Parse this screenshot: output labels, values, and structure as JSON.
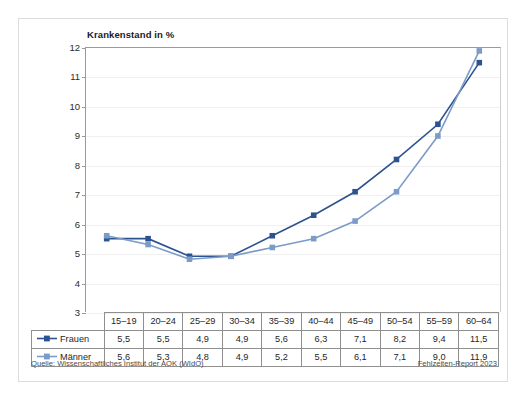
{
  "figure": {
    "chart_title": "Krankenstand in %"
  },
  "footer": {
    "source": "Quelle: Wissenschaftliches Institut der AOK (WIdO)",
    "report": "Fehlzeiten-Report 2023"
  },
  "colors": {
    "frauen": "#2d5290",
    "maenner": "#7b9bc9",
    "axis": "#9a9a9a",
    "grid": "#f0f0f0",
    "table_border": "#8f8f8f",
    "text": "#1f1f1f"
  },
  "chart_data": {
    "type": "line",
    "title": "Krankenstand in %",
    "xlabel": "",
    "ylabel": "Krankenstand in %",
    "categories": [
      "15–19",
      "20–24",
      "25–29",
      "30–34",
      "35–39",
      "40–44",
      "45–49",
      "50–54",
      "55–59",
      "60–64"
    ],
    "ylim": [
      3,
      12
    ],
    "yticks": [
      3,
      4,
      5,
      6,
      7,
      8,
      9,
      10,
      11,
      12
    ],
    "ytick_labels": [
      "3",
      "4",
      "5",
      "6",
      "7",
      "8",
      "9",
      "10",
      "11",
      "12"
    ],
    "grid": true,
    "legend_position": "table-row-header",
    "marker": "square",
    "series": [
      {
        "name": "Frauen",
        "color": "#2d5290",
        "values": [
          5.5,
          5.5,
          4.9,
          4.9,
          5.6,
          6.3,
          7.1,
          8.2,
          9.4,
          11.5
        ],
        "labels": [
          "5,5",
          "5,5",
          "4,9",
          "4,9",
          "5,6",
          "6,3",
          "7,1",
          "8,2",
          "9,4",
          "11,5"
        ]
      },
      {
        "name": "Männer",
        "color": "#7b9bc9",
        "values": [
          5.6,
          5.3,
          4.8,
          4.9,
          5.2,
          5.5,
          6.1,
          7.1,
          9.0,
          11.9
        ],
        "labels": [
          "5,6",
          "5,3",
          "4,8",
          "4,9",
          "5,2",
          "5,5",
          "6,1",
          "7,1",
          "9,0",
          "11,9"
        ]
      }
    ]
  }
}
